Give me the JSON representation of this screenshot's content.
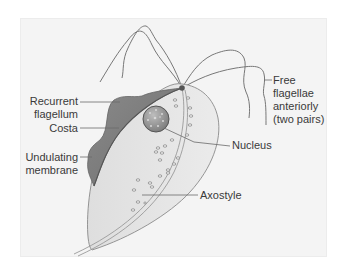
{
  "figure": {
    "labels": {
      "recurrent_flagellum": [
        "Recurrent",
        "flagellum"
      ],
      "costa": "Costa",
      "undulating_membrane": [
        "Undulating",
        "membrane"
      ],
      "free_flagellae": [
        "Free",
        "flagellae",
        "anteriorly",
        "(two pairs)"
      ],
      "nucleus": "Nucleus",
      "axostyle": "Axostyle"
    },
    "colors": {
      "panel_bg": "#f4f4f4",
      "body_fill": "#e6e6e6",
      "membrane_fill": "#808080",
      "line": "#6a6a6a",
      "text": "#3a3a3a"
    }
  }
}
